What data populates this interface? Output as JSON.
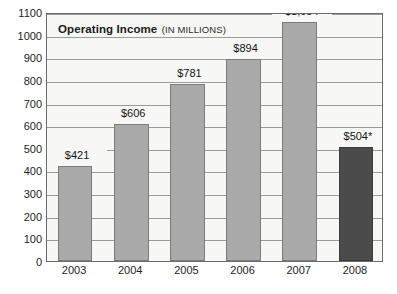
{
  "chart_data": {
    "type": "bar",
    "title": "Operating Income",
    "title_main": "Operating Income",
    "title_sub": "(IN MILLIONS)",
    "xlabel": "",
    "ylabel": "",
    "ylim": [
      0,
      1100
    ],
    "ytick_step": 100,
    "grid": true,
    "legend": "none",
    "categories": [
      "2003",
      "2004",
      "2005",
      "2006",
      "2007",
      "2008"
    ],
    "values": [
      421,
      606,
      781,
      894,
      1054,
      504
    ],
    "data_labels": [
      "$421",
      "$606",
      "$781",
      "$894",
      "$1,054",
      "$504*"
    ],
    "ytick_labels": [
      "1100",
      "1000",
      "900",
      "800",
      "700",
      "600",
      "500",
      "400",
      "300",
      "200",
      "100",
      "0"
    ],
    "ytick_values": [
      1100,
      1000,
      900,
      800,
      700,
      600,
      500,
      400,
      300,
      200,
      100,
      0
    ],
    "bar_colors": [
      "#a9a9a9",
      "#a9a9a9",
      "#a9a9a9",
      "#a9a9a9",
      "#a9a9a9",
      "#4b4b4b"
    ],
    "footnote_marker": "*"
  },
  "colors": {
    "series_light": "#a9a9a9",
    "series_dark": "#4b4b4b",
    "plot_background": "#f7f7f5",
    "gridline": "#9a9a9a",
    "frame_border": "#6b6b6b",
    "text": "#1d1d1d",
    "page_background": "#ffffff"
  }
}
